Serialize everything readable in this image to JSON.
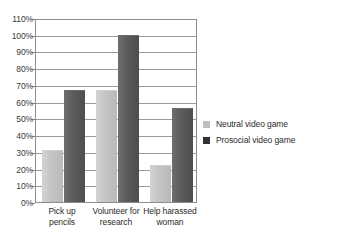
{
  "chart_data": {
    "type": "bar",
    "title": "",
    "subtitle": "",
    "xlabel": "",
    "ylabel": "",
    "categories": [
      "Pick up pencils",
      "Volunteer for research",
      "Help harassed woman"
    ],
    "category_lines": [
      [
        "Pick up pencils"
      ],
      [
        "Volunteer for",
        "research"
      ],
      [
        "Help harassed",
        "woman"
      ]
    ],
    "series": [
      {
        "name": "Neutral video game",
        "color": "#bfbfbf",
        "values": [
          31,
          67,
          22
        ]
      },
      {
        "name": "Prosocial video game",
        "color": "#333333",
        "values": [
          67,
          100,
          56
        ]
      }
    ],
    "ylim": [
      0,
      110
    ],
    "ytick_step": 10,
    "ytick_labels": [
      "110%",
      "100%",
      "90%",
      "80%",
      "70%",
      "60%",
      "50%",
      "40%",
      "30%",
      "20%",
      "10%",
      "0%"
    ],
    "ytick_values": [
      110,
      100,
      90,
      80,
      70,
      60,
      50,
      40,
      30,
      20,
      10,
      0
    ],
    "grid": true,
    "grid_axis": "y",
    "legend_position": "right",
    "value_suffix": "%"
  }
}
